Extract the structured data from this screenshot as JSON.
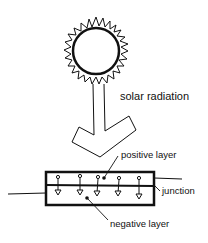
{
  "diagram": {
    "labels": {
      "solar_radiation": "solar radiation",
      "positive_layer": "positive layer",
      "junction": "junction",
      "negative_layer": "negative layer"
    },
    "elements": {
      "sun": {
        "center": [
          96,
          50
        ],
        "radius": 24,
        "ray_count": 22
      },
      "arrow": {
        "direction": "down",
        "from": "sun",
        "to": "cell"
      },
      "cell": {
        "box": {
          "x": 45,
          "y": 172,
          "width": 110,
          "height": 33
        },
        "junction_y": 185,
        "carrier_arrows": 5
      },
      "wires": [
        "left",
        "right"
      ]
    },
    "colors": {
      "ink": "#111111",
      "background": "#ffffff"
    }
  }
}
